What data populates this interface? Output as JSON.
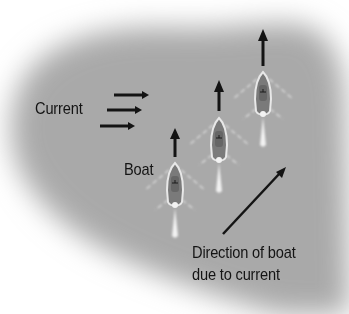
{
  "diagram": {
    "labels": {
      "current": "Current",
      "boat": "Boat",
      "direction_line1": "Direction of boat",
      "direction_line2": "due to current"
    },
    "elements": {
      "current_arrows": 3,
      "boats": 3,
      "boat_heading_arrows": 3,
      "resultant_arrow": "diagonal up-right"
    },
    "colors": {
      "water": "#a9a9a9",
      "background": "#ffffff",
      "ink": "#141414",
      "boat_outline": "#e8e8e8",
      "boat_hull": "#7a7a7a"
    }
  }
}
